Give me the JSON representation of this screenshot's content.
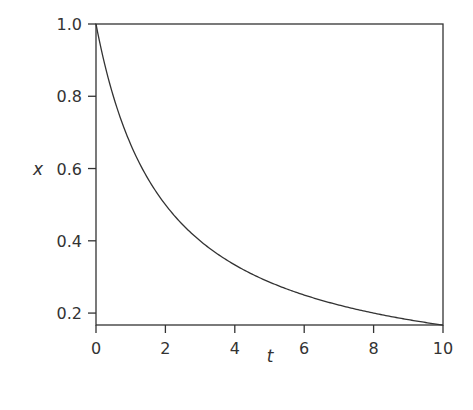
{
  "chart_data": {
    "type": "line",
    "title": "",
    "xlabel": "t",
    "ylabel": "x",
    "xlim": [
      0,
      10
    ],
    "ylim": [
      0.167,
      1.0
    ],
    "xticks": [
      "0",
      "2",
      "4",
      "6",
      "8",
      "10"
    ],
    "yticks": [
      "0.2",
      "0.4",
      "0.6",
      "0.8",
      "1.0"
    ],
    "grid": false,
    "legend": null,
    "series": [
      {
        "name": "x(t)",
        "x": [
          0,
          0.5,
          1,
          1.5,
          2,
          3,
          4,
          5,
          6,
          7,
          8,
          9,
          10
        ],
        "y": [
          1.0,
          0.8,
          0.667,
          0.571,
          0.5,
          0.4,
          0.333,
          0.286,
          0.25,
          0.222,
          0.2,
          0.182,
          0.167
        ]
      }
    ]
  }
}
